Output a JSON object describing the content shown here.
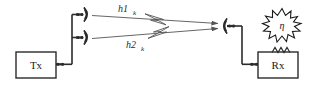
{
  "figure": {
    "width": 310,
    "height": 89,
    "background_color": "#ffffff",
    "line_color": "#2b2b2b",
    "path_color": "#555555"
  },
  "transmitter": {
    "label": "Tx",
    "antenna_count": 2,
    "antenna_names": [
      "tx-antenna-1",
      "tx-antenna-2"
    ]
  },
  "channels": [
    {
      "id": "h1",
      "base": "h1",
      "subscript": "k",
      "label": "h1k"
    },
    {
      "id": "h2",
      "base": "h2",
      "subscript": "k",
      "label": "h2k"
    }
  ],
  "receiver": {
    "label": "Rx",
    "antenna_count": 1,
    "noise_symbol": "η"
  }
}
